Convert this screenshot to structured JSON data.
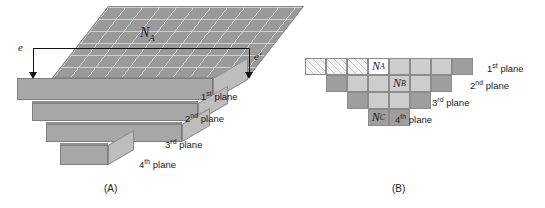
{
  "figure": {
    "panel_a": {
      "caption": "(A)",
      "dimension_label": "N",
      "dimension_sub": "A",
      "edge_left_label": "e",
      "edge_right_label": "e'",
      "plane_labels": [
        {
          "ordinal": "1",
          "suffix": "st",
          "text": " plane"
        },
        {
          "ordinal": "2",
          "suffix": "nd",
          "text": " plane"
        },
        {
          "ordinal": "3",
          "suffix": "rd",
          "text": " plane"
        },
        {
          "ordinal": "4",
          "suffix": "th",
          "text": " plane"
        }
      ]
    },
    "panel_b": {
      "caption": "(B)",
      "plane_labels": [
        {
          "ordinal": "1",
          "suffix": "st",
          "text": " plane"
        },
        {
          "ordinal": "2",
          "suffix": "nd",
          "text": " plane"
        },
        {
          "ordinal": "3",
          "suffix": "rd",
          "text": " plane"
        },
        {
          "ordinal": "4",
          "suffix": "th",
          "text": " plane"
        }
      ],
      "cell_labels": {
        "na": "N",
        "na_sub": "A",
        "nb": "N",
        "nb_sub": "B",
        "nc": "N",
        "nc_sub": "C"
      },
      "rows": [
        {
          "offset": 0,
          "cells": [
            {
              "fill": "hatch",
              "label": null
            },
            {
              "fill": "hatch",
              "label": null
            },
            {
              "fill": "hatch",
              "label": null
            },
            {
              "fill": "white",
              "label": "NA"
            },
            {
              "fill": "light",
              "label": null
            },
            {
              "fill": "light",
              "label": null
            },
            {
              "fill": "light",
              "label": null
            },
            {
              "fill": "dark",
              "label": null
            }
          ]
        },
        {
          "offset": 1,
          "cells": [
            {
              "fill": "dark",
              "label": null
            },
            {
              "fill": "light",
              "label": null
            },
            {
              "fill": "light",
              "label": null
            },
            {
              "fill": "light",
              "label": "NB"
            },
            {
              "fill": "light",
              "label": null
            },
            {
              "fill": "dark",
              "label": null
            }
          ]
        },
        {
          "offset": 2,
          "cells": [
            {
              "fill": "dark",
              "label": null
            },
            {
              "fill": "light",
              "label": null
            },
            {
              "fill": "light",
              "label": null
            },
            {
              "fill": "dark",
              "label": null
            }
          ]
        },
        {
          "offset": 3,
          "cells": [
            {
              "fill": "dark",
              "label": "NC"
            },
            {
              "fill": "dark",
              "label": null
            }
          ]
        }
      ]
    },
    "colors": {
      "hatch_fill": "#f2f2f2",
      "light_fill": "#cdcdcd",
      "dark_fill": "#9e9e9e",
      "white_fill": "#ffffff",
      "slab_top": "#9a9a9a",
      "slab_front": "#a7a7a7",
      "slab_side": "#bdbdbd",
      "line": "#111111"
    }
  }
}
